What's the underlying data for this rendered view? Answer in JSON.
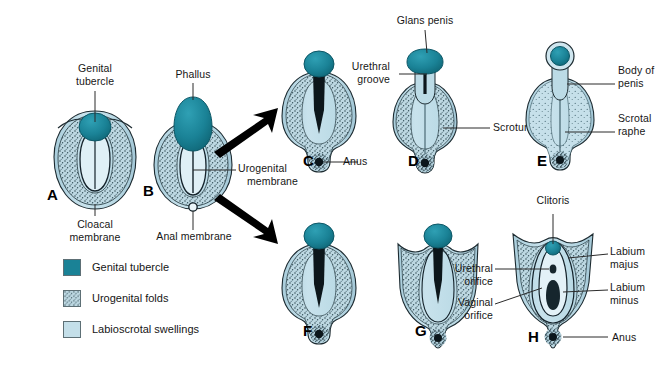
{
  "figure": {
    "background_color": "#ffffff"
  },
  "colors": {
    "genital_tubercle": "#1a8296",
    "genital_tubercle_dark": "#126a7c",
    "urogenital_folds": "#9fc2cf",
    "labioscrotal_swellings": "#bcdbe6",
    "stipple": "#2f4750",
    "outline": "#1d2b31",
    "leader_line": "#2b2b2b",
    "text": "#161616",
    "arrow": "#000000"
  },
  "stages": [
    {
      "id": "A",
      "letter": "A",
      "labels": [
        {
          "name": "genital-tubercle",
          "text": "Genital\ntubercle",
          "position": "top"
        },
        {
          "name": "cloacal-membrane",
          "text": "Cloacal\nmembrane",
          "position": "bottom"
        }
      ]
    },
    {
      "id": "B",
      "letter": "B",
      "labels": [
        {
          "name": "phallus",
          "text": "Phallus",
          "position": "top"
        },
        {
          "name": "urogenital-membrane",
          "text": "Urogenital\nmembrane",
          "position": "right"
        },
        {
          "name": "anal-membrane",
          "text": "Anal membrane",
          "position": "bottom"
        }
      ]
    },
    {
      "id": "C",
      "letter": "C",
      "labels": [
        {
          "name": "anus",
          "text": "Anus",
          "position": "right"
        }
      ]
    },
    {
      "id": "D",
      "letter": "D",
      "labels": [
        {
          "name": "glans-penis",
          "text": "Glans penis",
          "position": "top"
        },
        {
          "name": "urethral-groove",
          "text": "Urethral\ngroove",
          "position": "left"
        },
        {
          "name": "scrotum",
          "text": "Scrotum",
          "position": "right"
        }
      ]
    },
    {
      "id": "E",
      "letter": "E",
      "labels": [
        {
          "name": "body-of-penis",
          "text": "Body of\npenis",
          "position": "right"
        },
        {
          "name": "scrotal-raphe",
          "text": "Scrotal\nraphe",
          "position": "right"
        }
      ]
    },
    {
      "id": "F",
      "letter": "F",
      "labels": []
    },
    {
      "id": "G",
      "letter": "G",
      "labels": []
    },
    {
      "id": "H",
      "letter": "H",
      "labels": [
        {
          "name": "clitoris",
          "text": "Clitoris",
          "position": "top"
        },
        {
          "name": "labium-majus",
          "text": "Labium\nmajus",
          "position": "right"
        },
        {
          "name": "labium-minus",
          "text": "Labium\nminus",
          "position": "right"
        },
        {
          "name": "urethral-orifice",
          "text": "Urethral\norifice",
          "position": "left"
        },
        {
          "name": "vaginal-orifice",
          "text": "Vaginal\norifice",
          "position": "left"
        },
        {
          "name": "anus",
          "text": "Anus",
          "position": "right"
        }
      ]
    }
  ],
  "labels": {
    "genital_tubercle_l1": "Genital",
    "genital_tubercle_l2": "tubercle",
    "cloacal_membrane_l1": "Cloacal",
    "cloacal_membrane_l2": "membrane",
    "phallus": "Phallus",
    "urogenital_membrane_l1": "Urogenital",
    "urogenital_membrane_l2": "membrane",
    "anal_membrane": "Anal membrane",
    "anus_c": "Anus",
    "glans_penis": "Glans penis",
    "urethral_groove_l1": "Urethral",
    "urethral_groove_l2": "groove",
    "scrotum": "Scrotum",
    "body_of_penis_l1": "Body of",
    "body_of_penis_l2": "penis",
    "scrotal_raphe_l1": "Scrotal",
    "scrotal_raphe_l2": "raphe",
    "clitoris": "Clitoris",
    "labium_majus_l1": "Labium",
    "labium_majus_l2": "majus",
    "labium_minus_l1": "Labium",
    "labium_minus_l2": "minus",
    "urethral_orifice_l1": "Urethral",
    "urethral_orifice_l2": "orifice",
    "vaginal_orifice_l1": "Vaginal",
    "vaginal_orifice_l2": "orifice",
    "anus_h": "Anus"
  },
  "stage_letters": {
    "a": "A",
    "b": "B",
    "c": "C",
    "d": "D",
    "e": "E",
    "f": "F",
    "g": "G",
    "h": "H"
  },
  "legend": {
    "items": [
      {
        "name": "genital-tubercle",
        "label": "Genital tubercle",
        "color": "#1a8296",
        "pattern": "solid"
      },
      {
        "name": "urogenital-folds",
        "label": "Urogenital folds",
        "color": "#b9d2da",
        "pattern": "stipple"
      },
      {
        "name": "labioscrotal-swellings",
        "label": "Labioscrotal swellings",
        "color": "#c4dfe9",
        "pattern": "solid-light"
      }
    ]
  },
  "arrows": [
    {
      "name": "arrow-to-male",
      "direction": "up-right"
    },
    {
      "name": "arrow-to-female",
      "direction": "down-right"
    }
  ]
}
